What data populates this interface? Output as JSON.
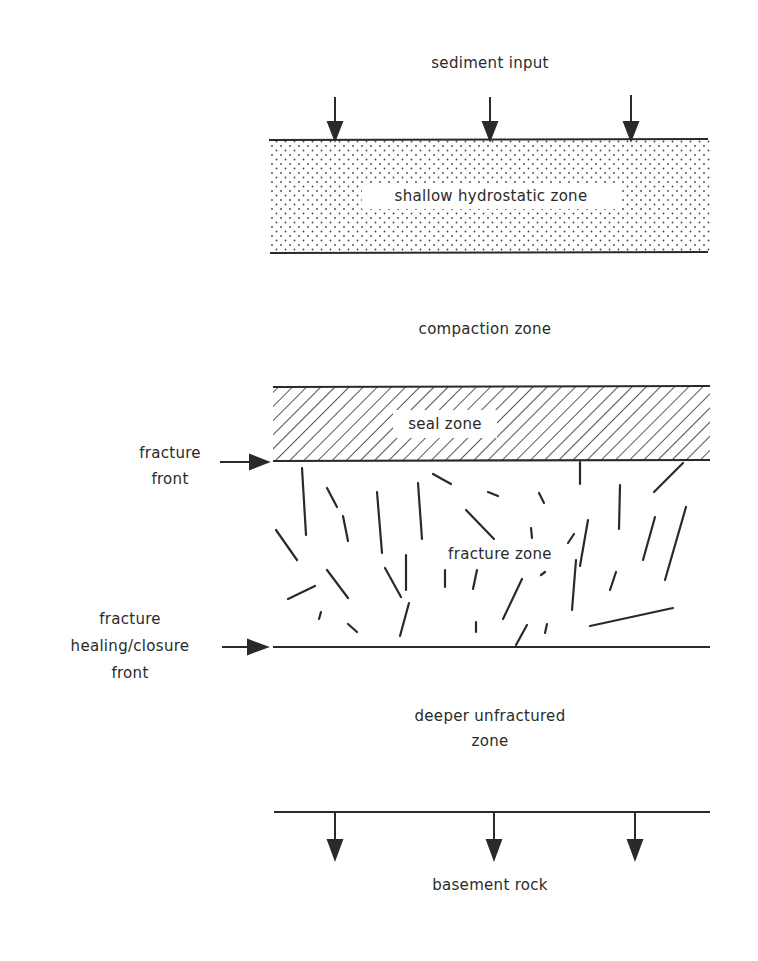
{
  "diagram": {
    "labels": {
      "sediment_input": "sediment input",
      "shallow_zone": "shallow hydrostatic zone",
      "compaction_zone": "compaction zone",
      "seal_zone": "seal zone",
      "fracture_front_1": "fracture",
      "fracture_front_2": "front",
      "fracture_zone": "fracture zone",
      "healing_front_1": "fracture",
      "healing_front_2": "healing/closure",
      "healing_front_3": "front",
      "deeper_zone_1": "deeper unfractured",
      "deeper_zone_2": "zone",
      "basement_rock": "basement rock"
    },
    "zones": [
      {
        "name": "shallow hydrostatic zone",
        "pattern": "stipple",
        "top_y": 139,
        "bottom_y": 253
      },
      {
        "name": "compaction zone",
        "pattern": "none"
      },
      {
        "name": "seal zone",
        "pattern": "diagonal-hatch",
        "top_y": 386,
        "bottom_y": 460
      },
      {
        "name": "fracture zone",
        "pattern": "fractures",
        "top_y": 460,
        "bottom_y": 647
      },
      {
        "name": "deeper unfractured zone",
        "pattern": "none"
      },
      {
        "name": "basement rock",
        "pattern": "none",
        "top_y": 811
      }
    ],
    "arrows": {
      "sediment_input": {
        "direction": "down",
        "count": 3
      },
      "basement": {
        "direction": "down",
        "count": 3
      },
      "fracture_front": {
        "direction": "right"
      },
      "healing_front": {
        "direction": "right"
      }
    },
    "colors": {
      "ink": "#2a2a2a",
      "background": "#ffffff"
    }
  }
}
